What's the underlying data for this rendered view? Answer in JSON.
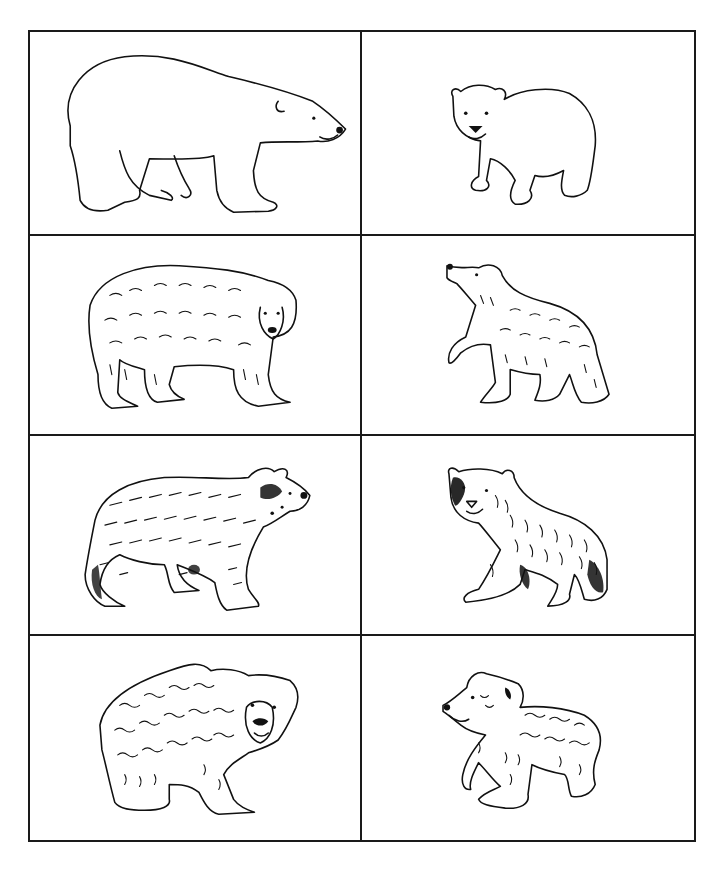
{
  "worksheet": {
    "layout": {
      "rows": 4,
      "columns": 2,
      "border_color": "#1a1a1a",
      "background": "#ffffff"
    },
    "cards": [
      {
        "row": 1,
        "column": 1,
        "subject": "polar bear",
        "age": "adult",
        "style": "outline",
        "facing": "right",
        "icon": "polar-bear-adult-icon"
      },
      {
        "row": 1,
        "column": 2,
        "subject": "polar bear",
        "age": "cub",
        "style": "outline",
        "facing": "front-left",
        "icon": "polar-bear-cub-icon"
      },
      {
        "row": 2,
        "column": 1,
        "subject": "brown bear",
        "age": "adult",
        "style": "furry",
        "facing": "front-right",
        "icon": "brown-bear-adult-icon"
      },
      {
        "row": 2,
        "column": 2,
        "subject": "brown bear",
        "age": "cub",
        "style": "furry",
        "facing": "up-left",
        "icon": "brown-bear-cub-icon"
      },
      {
        "row": 3,
        "column": 1,
        "subject": "spectacled bear",
        "age": "adult",
        "style": "dense-fur",
        "facing": "right",
        "icon": "spectacled-bear-adult-icon"
      },
      {
        "row": 3,
        "column": 2,
        "subject": "spectacled bear",
        "age": "cub",
        "style": "dense-fur",
        "facing": "front-left",
        "icon": "spectacled-bear-cub-icon"
      },
      {
        "row": 4,
        "column": 1,
        "subject": "sloth bear",
        "age": "adult",
        "style": "shaggy",
        "facing": "front-right",
        "icon": "sloth-bear-adult-icon"
      },
      {
        "row": 4,
        "column": 2,
        "subject": "sloth bear",
        "age": "cub",
        "style": "shaggy",
        "facing": "left",
        "icon": "sloth-bear-cub-icon"
      }
    ]
  }
}
